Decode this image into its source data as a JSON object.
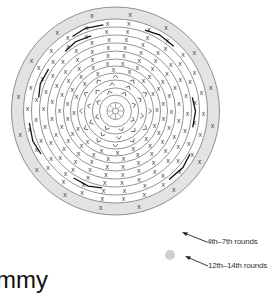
{
  "diagram": {
    "type": "crochet-round-chart",
    "center": [
      115.5,
      111
    ],
    "ring_radii": [
      104,
      92,
      84,
      76,
      68,
      60,
      52,
      45,
      38,
      31,
      23,
      16,
      8.5,
      3
    ],
    "shaded_band": {
      "outer": 104,
      "inner": 92,
      "color": "#e3e3e3"
    },
    "line_color": "#777777",
    "stitch_symbol": "x",
    "rounds_with_x": [
      {
        "r": 98,
        "count": 16
      },
      {
        "r": 88,
        "count": 26
      },
      {
        "r": 80,
        "count": 24
      },
      {
        "r": 72,
        "count": 26
      },
      {
        "r": 64,
        "count": 24
      },
      {
        "r": 56,
        "count": 22
      },
      {
        "r": 48.5,
        "count": 20
      },
      {
        "r": 41.5,
        "count": 16
      }
    ],
    "rounds_with_v": [
      {
        "r": 34.5,
        "count": 12
      },
      {
        "r": 27,
        "count": 10
      },
      {
        "r": 19.5,
        "count": 8
      }
    ],
    "spokes": {
      "inner": 3,
      "outer": 8.5,
      "count": 8
    }
  },
  "legend": {
    "items": [
      {
        "label": "4th–7th rounds",
        "swatch": "none"
      },
      {
        "label": "12th–14th rounds",
        "swatch": "#d0d0d0"
      }
    ]
  },
  "caption_fragment": "mmy"
}
